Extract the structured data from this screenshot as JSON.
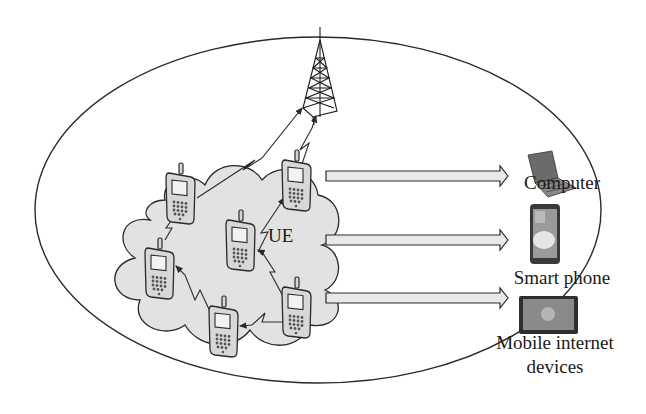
{
  "diagram": {
    "type": "network-illustration",
    "labels": {
      "ue": "UE",
      "computer": "Computer",
      "smart_phone": "Smart phone",
      "mobile_internet_line1": "Mobile internet",
      "mobile_internet_line2": "devices"
    },
    "nodes": [
      {
        "id": "tower",
        "kind": "base-station-tower"
      },
      {
        "id": "ue1",
        "kind": "mobile-handset"
      },
      {
        "id": "ue2",
        "kind": "mobile-handset"
      },
      {
        "id": "ue3",
        "kind": "mobile-handset"
      },
      {
        "id": "ue4",
        "kind": "mobile-handset"
      },
      {
        "id": "ue5",
        "kind": "mobile-handset"
      },
      {
        "id": "ue6",
        "kind": "mobile-handset"
      },
      {
        "id": "computer",
        "kind": "laptop"
      },
      {
        "id": "smart_phone",
        "kind": "smartphone"
      },
      {
        "id": "mid",
        "kind": "tablet"
      }
    ],
    "links": [
      {
        "from": "ue1",
        "to": "tower",
        "style": "wireless-zigzag"
      },
      {
        "from": "ue4",
        "to": "tower",
        "style": "wireless-zigzag"
      },
      {
        "from": "ue2",
        "to": "ue1",
        "style": "wireless-zigzag"
      },
      {
        "from": "ue3",
        "to": "ue4",
        "style": "wireless-zigzag"
      },
      {
        "from": "ue5",
        "to": "ue2",
        "style": "wireless-zigzag"
      },
      {
        "from": "ue6",
        "to": "ue3",
        "style": "wireless-zigzag"
      },
      {
        "from": "ue6",
        "to": "ue5",
        "style": "wireless-zigzag"
      },
      {
        "from": "ue-cluster",
        "to": "computer",
        "style": "block-arrow"
      },
      {
        "from": "ue-cluster",
        "to": "smart_phone",
        "style": "block-arrow"
      },
      {
        "from": "ue-cluster",
        "to": "mid",
        "style": "block-arrow"
      }
    ],
    "colors": {
      "stroke": "#2a2a2a",
      "cloud_fill": "#e2e2e2",
      "handset_fill": "#d6d6d6",
      "arrow_fill": "#e8e8e8",
      "background": "#ffffff"
    }
  }
}
